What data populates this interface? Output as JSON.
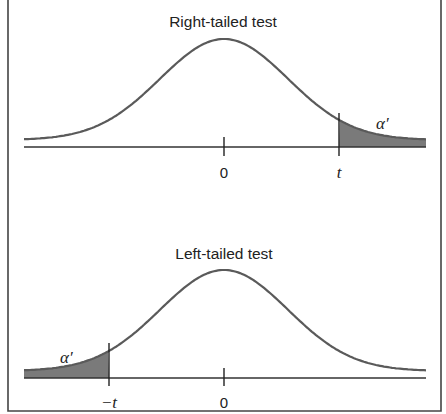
{
  "panels": [
    {
      "id": "right",
      "title": "Right-tailed test",
      "tail_side": "right",
      "tail_label": "α′",
      "tick_labels": {
        "center": "0",
        "critical": "t"
      }
    },
    {
      "id": "left",
      "title": "Left-tailed test",
      "tail_side": "left",
      "tail_label": "α′",
      "tick_labels": {
        "center": "0",
        "critical": "−t"
      }
    }
  ],
  "colors": {
    "curve": "#5a5a5a",
    "tail_fill": "#7a7a7a",
    "axis": "#333333",
    "frame": "#444444",
    "text": "#222222"
  }
}
